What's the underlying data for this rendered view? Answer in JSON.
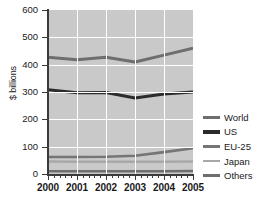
{
  "chart_data": {
    "type": "line",
    "title": "",
    "xlabel": "",
    "ylabel": "$ billions",
    "categories": [
      "2000",
      "2001",
      "2002",
      "2003",
      "2004",
      "2005"
    ],
    "x": [
      2000,
      2001,
      2002,
      2003,
      2004,
      2005
    ],
    "ylim": [
      0,
      600
    ],
    "xlim": [
      2000,
      2005
    ],
    "yticks": [
      0,
      100,
      200,
      300,
      400,
      500,
      600
    ],
    "ytick_labels": [
      "0",
      "100",
      "200",
      "300",
      "400",
      "500",
      "600"
    ],
    "xtick_labels": [
      "2000",
      "2001",
      "2002",
      "2003",
      "2004",
      "2005"
    ],
    "grid": true,
    "grid_color": "#ffffff",
    "plot_background": "#c9c9c9",
    "legend_position": "right",
    "series": [
      {
        "name": "World",
        "color": "#6e6e6e",
        "width": 3.0,
        "values": [
          427,
          418,
          427,
          410,
          435,
          460
        ]
      },
      {
        "name": "US",
        "color": "#2b2b2b",
        "width": 3.0,
        "values": [
          308,
          297,
          298,
          278,
          293,
          300
        ]
      },
      {
        "name": "EU-25",
        "color": "#757575",
        "width": 2.6,
        "values": [
          62,
          62,
          63,
          67,
          80,
          94
        ]
      },
      {
        "name": "Japan",
        "color": "#a8a8a8",
        "width": 2.6,
        "values": [
          46,
          45,
          45,
          45,
          45,
          46
        ]
      },
      {
        "name": "Others",
        "color": "#6e6e6e",
        "width": 2.6,
        "values": [
          10,
          10,
          10,
          10,
          10,
          11
        ]
      }
    ]
  }
}
